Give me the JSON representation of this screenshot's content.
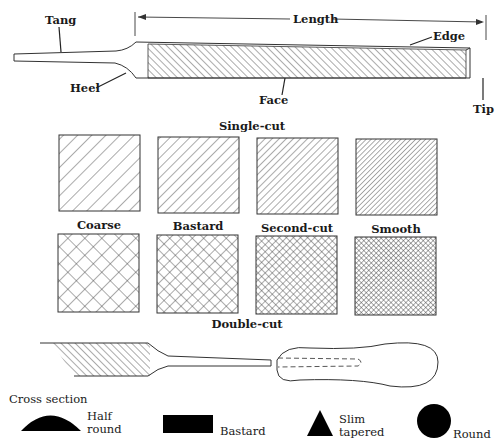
{
  "file_diagram": {
    "labels": {
      "tang": "Tang",
      "heel": "Heel",
      "length": "Length",
      "edge": "Edge",
      "face": "Face",
      "tip": "Tip"
    }
  },
  "cuts": {
    "single_title": "Single-cut",
    "double_title": "Double-cut",
    "grades": [
      {
        "name": "Coarse",
        "spacing": 10
      },
      {
        "name": "Bastard",
        "spacing": 7
      },
      {
        "name": "Second-cut",
        "spacing": 5
      },
      {
        "name": "Smooth",
        "spacing": 3.5
      }
    ]
  },
  "cross_section": {
    "title": "Cross section",
    "shapes": [
      {
        "line1": "Half",
        "line2": "round",
        "shape": "half-round"
      },
      {
        "line1": "Bastard",
        "line2": "",
        "shape": "rectangle"
      },
      {
        "line1": "Slim",
        "line2": "tapered",
        "shape": "triangle"
      },
      {
        "line1": "Round",
        "line2": "",
        "shape": "circle"
      }
    ]
  },
  "colors": {
    "ink": "#333333",
    "background": "#ffffff"
  }
}
